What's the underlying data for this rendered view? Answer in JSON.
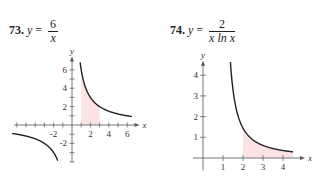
{
  "problems": [
    {
      "number": "73.",
      "lhs": "y",
      "eq": "=",
      "numerator": "6",
      "denominator": "x"
    },
    {
      "number": "74.",
      "lhs": "y",
      "eq": "=",
      "numerator": "2",
      "denominator": "x ln x"
    }
  ],
  "colors": {
    "curve": "#231f20",
    "axis": "#555555",
    "shade": "#fbe3e4"
  },
  "chart_data": [
    {
      "type": "line",
      "title": "y = 6/x",
      "xlabel": "x",
      "ylabel": "y",
      "xlim": [
        -6.5,
        7
      ],
      "ylim": [
        -4,
        7
      ],
      "x_tick_labels": [
        "-2",
        "2",
        "4",
        "6"
      ],
      "x_tick_values": [
        -2,
        2,
        4,
        6
      ],
      "y_tick_labels": [
        "-2",
        "2",
        "4",
        "6"
      ],
      "y_tick_values": [
        -2,
        2,
        4,
        6
      ],
      "minor_ticks_every": 1,
      "series": [
        {
          "name": "y=6/x (x>0)",
          "function": "6/x",
          "x_range": [
            0.88,
            6.5
          ]
        },
        {
          "name": "y=6/x (x<0)",
          "function": "6/x",
          "x_range": [
            -6.5,
            -1.55
          ]
        }
      ],
      "shaded_region": {
        "x_from": 1,
        "x_to": 3,
        "under": "6/x"
      },
      "grid": false
    },
    {
      "type": "line",
      "title": "y = 2/(x ln x)",
      "xlabel": "x",
      "ylabel": "y",
      "xlim": [
        0,
        4.8
      ],
      "ylim": [
        -0.5,
        4.6
      ],
      "x_tick_labels": [
        "1",
        "2",
        "3",
        "4"
      ],
      "x_tick_values": [
        1,
        2,
        3,
        4
      ],
      "y_tick_labels": [
        "1",
        "2",
        "3",
        "4"
      ],
      "y_tick_values": [
        1,
        2,
        3,
        4
      ],
      "series": [
        {
          "name": "y=2/(x ln x)",
          "function": "2/(x*ln(x))",
          "x_range": [
            1.37,
            4.5
          ]
        }
      ],
      "shaded_region": {
        "x_from": 2,
        "x_to": 4.5,
        "under": "2/(x*ln(x))"
      },
      "grid": false
    }
  ]
}
